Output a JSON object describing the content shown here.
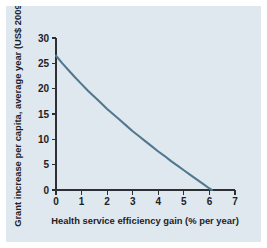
{
  "figure": {
    "background_color": "#dfe8ee",
    "page_background": "#ffffff"
  },
  "chart_data": {
    "type": "line",
    "title": "",
    "subtitle": "",
    "xlabel": "Health service efficiency gain (% per year)",
    "ylabel": "Grant increase per capita, average year (US$ 2009)",
    "xlim": [
      0,
      7
    ],
    "ylim": [
      0,
      30
    ],
    "xticks": [
      0,
      1,
      2,
      3,
      4,
      5,
      6,
      7
    ],
    "xtick_labels": [
      "0",
      "1",
      "2",
      "3",
      "4",
      "5",
      "6",
      "7"
    ],
    "yticks": [
      0,
      5,
      10,
      15,
      20,
      25,
      30
    ],
    "ytick_labels": [
      "0",
      "5",
      "10",
      "15",
      "20",
      "25",
      "30"
    ],
    "grid": false,
    "legend": null,
    "series": [
      {
        "name": "Grant increase per capita",
        "color": "#52788f",
        "x": [
          0.0,
          0.25,
          0.5,
          0.75,
          1.0,
          1.25,
          1.5,
          1.75,
          2.0,
          2.25,
          2.5,
          2.75,
          3.0,
          3.25,
          3.5,
          3.75,
          4.0,
          4.25,
          4.5,
          4.75,
          5.0,
          5.25,
          5.5,
          5.75,
          6.0,
          6.1
        ],
        "y": [
          26.5,
          25.0,
          23.6,
          22.2,
          20.9,
          19.6,
          18.4,
          17.2,
          16.0,
          14.9,
          13.8,
          12.7,
          11.6,
          10.6,
          9.6,
          8.6,
          7.6,
          6.7,
          5.7,
          4.8,
          3.9,
          3.0,
          2.1,
          1.2,
          0.3,
          0.0
        ]
      }
    ]
  }
}
